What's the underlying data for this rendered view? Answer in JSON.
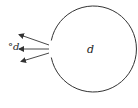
{
  "diagram": {
    "inner_label": "d",
    "outer_label": "°d",
    "stroke_color": "#333333",
    "background": "#ffffff",
    "circle": {
      "cx": 93,
      "cy": 49,
      "r": 43
    },
    "arrows": [
      {
        "from": [
          49,
          45
        ],
        "to": [
          18,
          34
        ]
      },
      {
        "from": [
          49,
          49
        ],
        "to": [
          18,
          49
        ]
      },
      {
        "from": [
          49,
          53
        ],
        "to": [
          20,
          62
        ]
      }
    ]
  }
}
